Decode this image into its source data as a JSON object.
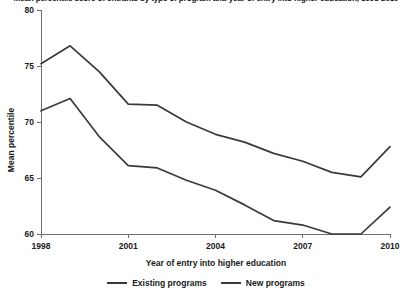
{
  "chart_data": {
    "type": "line",
    "title": "Mean percentile score of entrants by type of program and year of entry into higher education, 1998-2010",
    "xlabel": "Year of entry into higher education",
    "ylabel": "Mean percentile",
    "x": [
      1998,
      1999,
      2000,
      2001,
      2002,
      2003,
      2004,
      2005,
      2006,
      2007,
      2008,
      2009,
      2010
    ],
    "xlim": [
      1998,
      2010
    ],
    "ylim": [
      60,
      80
    ],
    "xticks": [
      "1998",
      "2001",
      "2004",
      "2007",
      "2010"
    ],
    "xtick_values": [
      1998,
      2001,
      2004,
      2007,
      2010
    ],
    "yticks": [
      "60",
      "65",
      "70",
      "75",
      "80"
    ],
    "ytick_values": [
      60,
      65,
      70,
      75,
      80
    ],
    "grid": false,
    "legend_position": "bottom",
    "series": [
      {
        "name": "Existing programs",
        "color": "#3a3a3a",
        "values": [
          75.2,
          76.8,
          74.5,
          71.6,
          71.5,
          70.0,
          68.9,
          68.2,
          67.2,
          66.5,
          65.5,
          65.1,
          67.8
        ]
      },
      {
        "name": "New programs",
        "color": "#3a3a3a",
        "values": [
          71.0,
          72.1,
          68.7,
          66.1,
          65.9,
          64.8,
          63.9,
          62.6,
          61.2,
          60.8,
          60.0,
          60.0,
          62.4
        ]
      }
    ]
  }
}
